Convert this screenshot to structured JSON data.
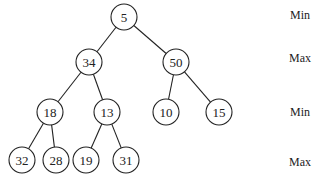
{
  "diagram": {
    "type": "min-max-heap",
    "nodes": [
      {
        "id": "n0",
        "value": "5",
        "x": 124,
        "y": 17
      },
      {
        "id": "n1",
        "value": "34",
        "x": 89,
        "y": 62
      },
      {
        "id": "n2",
        "value": "50",
        "x": 176,
        "y": 62
      },
      {
        "id": "n3",
        "value": "18",
        "x": 50,
        "y": 112
      },
      {
        "id": "n4",
        "value": "13",
        "x": 107,
        "y": 112
      },
      {
        "id": "n5",
        "value": "10",
        "x": 166,
        "y": 112
      },
      {
        "id": "n6",
        "value": "15",
        "x": 219,
        "y": 112
      },
      {
        "id": "n7",
        "value": "32",
        "x": 22,
        "y": 160
      },
      {
        "id": "n8",
        "value": "28",
        "x": 56,
        "y": 160
      },
      {
        "id": "n9",
        "value": "19",
        "x": 86,
        "y": 160
      },
      {
        "id": "n10",
        "value": "31",
        "x": 126,
        "y": 160
      }
    ],
    "edges": [
      [
        "n0",
        "n1"
      ],
      [
        "n0",
        "n2"
      ],
      [
        "n1",
        "n3"
      ],
      [
        "n1",
        "n4"
      ],
      [
        "n2",
        "n5"
      ],
      [
        "n2",
        "n6"
      ],
      [
        "n3",
        "n7"
      ],
      [
        "n3",
        "n8"
      ],
      [
        "n4",
        "n9"
      ],
      [
        "n4",
        "n10"
      ]
    ],
    "level_labels": [
      {
        "text": "Min",
        "y": 16
      },
      {
        "text": "Max",
        "y": 59
      },
      {
        "text": "Min",
        "y": 113
      },
      {
        "text": "Max",
        "y": 163
      }
    ]
  }
}
